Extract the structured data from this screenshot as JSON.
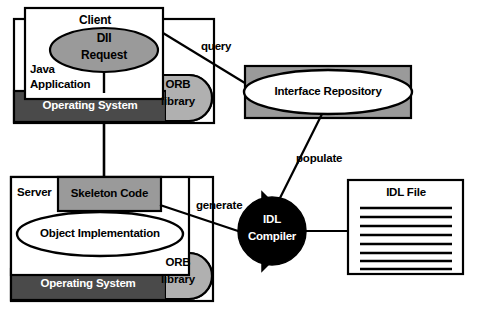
{
  "diagram": {
    "type": "architecture-block-diagram",
    "colors": {
      "background": "#ffffff",
      "outline": "#000000",
      "os_bar_fill": "#4a4a4a",
      "os_bar_text": "#ffffff",
      "orb_fill": "#b0b0b0",
      "dii_fill": "#9a9a9a",
      "skeleton_fill": "#9a9a9a",
      "repository_box_fill": "#9a9a9a",
      "repository_ellipse_fill": "#ffffff",
      "compiler_fill": "#000000",
      "compiler_text": "#ffffff",
      "white_fill": "#ffffff"
    },
    "nodes": {
      "java_application": "Java\nApplication",
      "client": "Client",
      "dii_request": "DII\nRequest",
      "orb_library_top": "ORB\nlibrary",
      "operating_system_top": "Operating System",
      "interface_repository": "Interface Repository",
      "server": "Server",
      "skeleton_code": "Skeleton Code",
      "object_implementation": "Object Implementation",
      "orb_library_bottom": "ORB\nlibrary",
      "operating_system_bottom": "Operating System",
      "idl_compiler": "IDL\nCompiler",
      "idl_file": "IDL File"
    },
    "node_labels": {
      "java_application_line1": "Java",
      "java_application_line2": "Application",
      "client": "Client",
      "dii_line1": "DII",
      "dii_line2": "Request",
      "orb_top_line1": "ORB",
      "orb_top_line2": "library",
      "os_top": "Operating System",
      "interface_repository": "Interface Repository",
      "server": "Server",
      "skeleton_code": "Skeleton Code",
      "object_implementation": "Object Implementation",
      "orb_bottom_line1": "ORB",
      "orb_bottom_line2": "library",
      "os_bottom": "Operating System",
      "idl_compiler_line1": "IDL",
      "idl_compiler_line2": "Compiler",
      "idl_file": "IDL File"
    },
    "edges": [
      {
        "id": "query",
        "label": "query",
        "from": "client",
        "to": "interface_repository"
      },
      {
        "id": "populate",
        "label": "populate",
        "from": "idl_compiler",
        "to": "interface_repository"
      },
      {
        "id": "generate",
        "label": "generate",
        "from": "idl_compiler",
        "to": "skeleton_code"
      },
      {
        "id": "compiler-to-file",
        "label": "",
        "from": "idl_compiler",
        "to": "idl_file"
      },
      {
        "id": "os-link",
        "label": "",
        "from": "operating_system_top",
        "to": "operating_system_bottom"
      }
    ],
    "edge_labels": {
      "query": "query",
      "populate": "populate",
      "generate": "generate"
    },
    "idl_file_line_count": 8
  }
}
